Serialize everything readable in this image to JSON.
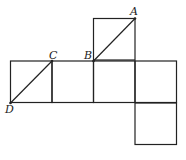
{
  "diagram": {
    "points": {
      "A": {
        "label": "A",
        "x": 135,
        "y": 18.5
      },
      "B": {
        "label": "B",
        "x": 93.5,
        "y": 61
      },
      "C": {
        "label": "C",
        "x": 52,
        "y": 61
      },
      "D": {
        "label": "D",
        "x": 10.5,
        "y": 103
      }
    },
    "squares": [
      {
        "x": 93.5,
        "y": 18.5
      },
      {
        "x": 10.5,
        "y": 61
      },
      {
        "x": 52,
        "y": 61
      },
      {
        "x": 93.5,
        "y": 61
      },
      {
        "x": 135,
        "y": 61
      },
      {
        "x": 135,
        "y": 103
      }
    ],
    "segments": [
      {
        "from": "B",
        "to": "A"
      },
      {
        "from": "D",
        "to": "C"
      }
    ],
    "square_size": 41.5,
    "stroke_color": "#222222"
  }
}
